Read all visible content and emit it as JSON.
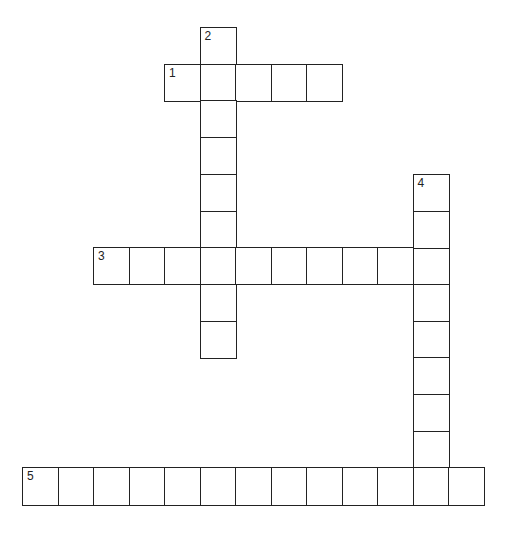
{
  "puzzle": {
    "type": "crossword",
    "cell_width": 35.5,
    "cell_height": 36.7,
    "origin_x": 22,
    "origin_y": 27,
    "grid_line_color": "#222222",
    "background_color": "#ffffff"
  },
  "words": [
    {
      "number": "1",
      "direction": "across",
      "row": 1,
      "col": 4,
      "length": 5
    },
    {
      "number": "2",
      "direction": "down",
      "row": 0,
      "col": 5,
      "length": 9
    },
    {
      "number": "3",
      "direction": "across",
      "row": 6,
      "col": 2,
      "length": 10
    },
    {
      "number": "4",
      "direction": "down",
      "row": 4,
      "col": 11,
      "length": 9
    },
    {
      "number": "5",
      "direction": "across",
      "row": 12,
      "col": 0,
      "length": 13
    }
  ]
}
